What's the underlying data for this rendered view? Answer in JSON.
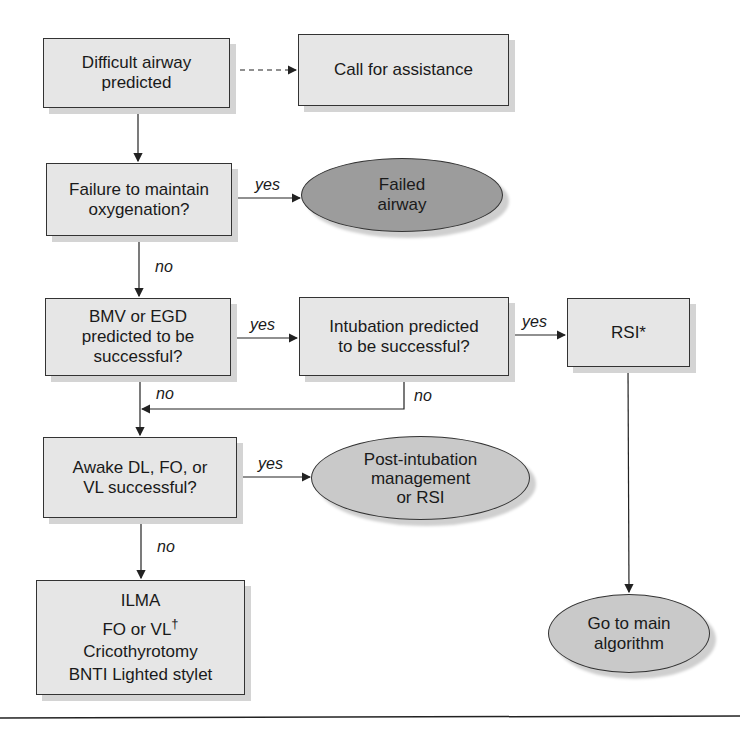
{
  "nodes": {
    "difficult_airway": {
      "text": "Difficult airway\npredicted"
    },
    "call_assistance": {
      "text": "Call for assistance"
    },
    "failure_oxygenation": {
      "text": "Failure to maintain\noxygenation?"
    },
    "failed_airway": {
      "text": "Failed\nairway"
    },
    "bmv_egd": {
      "text": "BMV or EGD\npredicted to be\nsuccessful?"
    },
    "intubation_predicted": {
      "text": "Intubation predicted\nto be successful?"
    },
    "rsi": {
      "text": "RSI*"
    },
    "awake": {
      "text": "Awake DL, FO, or\nVL successful?"
    },
    "post_intubation": {
      "text": "Post-intubation\nmanagement\nor RSI"
    },
    "alternatives": {
      "line1": "ILMA",
      "line2": "FO or VL",
      "dagger": "†",
      "line3": "Cricothyrotomy",
      "line4": "BNTI Lighted stylet"
    },
    "main_algorithm": {
      "text": "Go to main\nalgorithm"
    }
  },
  "labels": {
    "yes1": "yes",
    "no1": "no",
    "yes2": "yes",
    "yes3": "yes",
    "no2": "no",
    "no3": "no",
    "yes4": "yes",
    "no4": "no"
  },
  "colors": {
    "box_fill": "#e6e6e6",
    "dark_ellipse": "#9c9c9c",
    "light_ellipse": "#c9c9c9",
    "stroke": "#333333"
  }
}
